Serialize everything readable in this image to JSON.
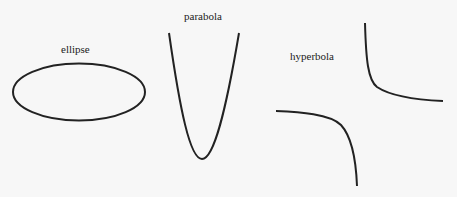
{
  "diagram": {
    "stroke_color": "#222222",
    "background": "#f7f7f7",
    "shapes": [
      {
        "id": "ellipse",
        "label": "ellipse"
      },
      {
        "id": "parabola",
        "label": "parabola"
      },
      {
        "id": "hyperbola",
        "label": "hyperbola"
      }
    ]
  }
}
